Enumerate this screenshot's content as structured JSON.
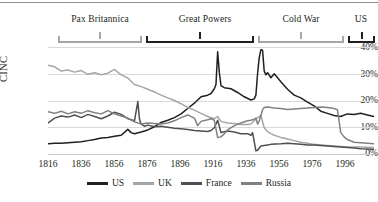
{
  "chart_data": {
    "type": "line",
    "title": "",
    "xlabel": "",
    "ylabel": "CINC",
    "xlim": [
      1816,
      2012
    ],
    "ylim": [
      0,
      0.44
    ],
    "grid": true,
    "legend_position": "bottom",
    "x_ticks": [
      "1816",
      "1836",
      "1856",
      "1876",
      "1896",
      "1916",
      "1936",
      "1956",
      "1976",
      "1996"
    ],
    "x_tick_values": [
      1816,
      1836,
      1856,
      1876,
      1896,
      1916,
      1936,
      1956,
      1976,
      1996
    ],
    "y_ticks": [
      "0%",
      "10%",
      "20%",
      "30%",
      "40%"
    ],
    "y_tick_values": [
      0,
      10,
      20,
      30,
      40
    ],
    "annotations": [
      {
        "label": "Pax Britannica",
        "start": 1816,
        "end": 1866,
        "color": "#a6a6a6"
      },
      {
        "label": "Great Powers",
        "start": 1869,
        "end": 1943,
        "color": "#231f20"
      },
      {
        "label": "Cold War",
        "start": 1945,
        "end": 1989,
        "color": "#a6a6a6"
      },
      {
        "label": "US",
        "start": 1991,
        "end": 2012,
        "color": "#231f20"
      }
    ],
    "series": [
      {
        "name": "US",
        "color": "#231f20",
        "x": [
          1816,
          1820,
          1824,
          1828,
          1832,
          1836,
          1840,
          1844,
          1848,
          1852,
          1856,
          1860,
          1864,
          1866,
          1868,
          1872,
          1876,
          1880,
          1884,
          1888,
          1892,
          1896,
          1900,
          1904,
          1908,
          1912,
          1914,
          1916,
          1917,
          1918,
          1919,
          1920,
          1922,
          1926,
          1930,
          1934,
          1938,
          1940,
          1941,
          1942,
          1943,
          1944,
          1945,
          1946,
          1947,
          1948,
          1950,
          1952,
          1956,
          1960,
          1964,
          1968,
          1972,
          1976,
          1980,
          1984,
          1988,
          1992,
          1996,
          2000,
          2004,
          2008,
          2012
        ],
        "y": [
          3.8,
          4.0,
          4.0,
          4.2,
          4.4,
          4.6,
          5.0,
          5.4,
          6.0,
          6.2,
          6.6,
          7.0,
          9.2,
          8.0,
          7.6,
          8.2,
          9.0,
          10.2,
          11.8,
          12.6,
          13.6,
          15.0,
          17.0,
          19.0,
          21.4,
          22.0,
          22.6,
          24.4,
          26.0,
          38.2,
          30.5,
          25.6,
          24.8,
          24.4,
          23.0,
          21.4,
          20.2,
          20.6,
          22.0,
          30.0,
          36.0,
          39.0,
          38.8,
          31.0,
          29.6,
          30.4,
          28.5,
          30.0,
          27.0,
          24.2,
          22.0,
          21.0,
          19.4,
          18.0,
          16.0,
          15.2,
          14.4,
          14.0,
          15.0,
          14.8,
          15.2,
          14.6,
          14.0
        ]
      },
      {
        "name": "UK",
        "color": "#a6a6a6",
        "x": [
          1816,
          1820,
          1824,
          1828,
          1832,
          1836,
          1840,
          1844,
          1848,
          1852,
          1856,
          1860,
          1864,
          1868,
          1872,
          1876,
          1880,
          1884,
          1888,
          1892,
          1896,
          1900,
          1904,
          1908,
          1912,
          1916,
          1918,
          1920,
          1924,
          1928,
          1932,
          1936,
          1938,
          1940,
          1942,
          1944,
          1946,
          1948,
          1950,
          1952,
          1956,
          1960,
          1964,
          1968,
          1972,
          1976,
          1980,
          1984,
          1988,
          1992,
          1996,
          2000,
          2004,
          2008,
          2012
        ],
        "y": [
          33.2,
          32.6,
          31.0,
          31.4,
          30.6,
          31.2,
          29.8,
          30.4,
          29.6,
          30.2,
          31.6,
          29.6,
          28.4,
          26.0,
          25.2,
          24.2,
          23.2,
          22.0,
          21.0,
          20.0,
          18.8,
          17.4,
          16.4,
          15.2,
          14.0,
          13.2,
          14.0,
          12.2,
          11.6,
          11.4,
          11.0,
          11.0,
          11.2,
          12.4,
          13.6,
          14.4,
          9.8,
          8.4,
          7.6,
          7.0,
          6.2,
          5.6,
          5.0,
          4.4,
          4.0,
          3.6,
          3.4,
          3.2,
          3.0,
          2.8,
          2.6,
          2.6,
          2.6,
          2.5,
          2.4
        ]
      },
      {
        "name": "France",
        "color": "#4f4f4f",
        "x": [
          1816,
          1820,
          1824,
          1828,
          1832,
          1836,
          1840,
          1844,
          1848,
          1852,
          1856,
          1860,
          1864,
          1866,
          1868,
          1870,
          1871,
          1872,
          1874,
          1876,
          1880,
          1884,
          1888,
          1892,
          1896,
          1900,
          1904,
          1908,
          1912,
          1914,
          1916,
          1918,
          1920,
          1924,
          1928,
          1932,
          1936,
          1938,
          1939,
          1940,
          1941,
          1942,
          1944,
          1946,
          1948,
          1950,
          1956,
          1960,
          1964,
          1968,
          1972,
          1976,
          1980,
          1984,
          1988,
          1992,
          1996,
          2000,
          2004,
          2008,
          2012
        ],
        "y": [
          11.6,
          13.4,
          14.2,
          13.8,
          14.6,
          13.6,
          14.8,
          14.0,
          13.2,
          14.2,
          15.6,
          14.8,
          13.2,
          12.8,
          12.4,
          19.6,
          13.0,
          11.2,
          10.4,
          10.8,
          10.2,
          10.4,
          10.0,
          9.6,
          9.4,
          9.2,
          8.8,
          8.6,
          8.4,
          8.8,
          9.8,
          12.6,
          8.0,
          8.6,
          8.2,
          7.6,
          7.6,
          7.0,
          8.0,
          4.6,
          1.2,
          1.4,
          3.0,
          3.2,
          3.4,
          3.6,
          3.8,
          4.0,
          3.8,
          3.6,
          3.4,
          3.4,
          3.2,
          3.0,
          2.8,
          2.6,
          2.4,
          2.2,
          2.0,
          1.9,
          1.8
        ]
      },
      {
        "name": "Russia",
        "color": "#808080",
        "x": [
          1816,
          1820,
          1824,
          1828,
          1832,
          1836,
          1840,
          1844,
          1848,
          1852,
          1856,
          1860,
          1864,
          1868,
          1872,
          1876,
          1880,
          1884,
          1888,
          1892,
          1896,
          1900,
          1904,
          1906,
          1908,
          1912,
          1914,
          1916,
          1917,
          1918,
          1920,
          1922,
          1924,
          1928,
          1932,
          1936,
          1938,
          1940,
          1941,
          1942,
          1943,
          1944,
          1945,
          1946,
          1948,
          1950,
          1952,
          1956,
          1960,
          1964,
          1968,
          1972,
          1976,
          1980,
          1984,
          1988,
          1990,
          1992,
          1994,
          1996,
          2000,
          2004,
          2008,
          2012
        ],
        "y": [
          15.8,
          15.2,
          16.0,
          15.0,
          15.8,
          15.2,
          16.2,
          15.4,
          15.0,
          16.2,
          15.0,
          14.2,
          13.4,
          12.0,
          11.2,
          11.6,
          11.4,
          11.2,
          11.6,
          12.4,
          13.6,
          14.6,
          13.4,
          10.6,
          12.2,
          12.8,
          13.2,
          12.6,
          9.4,
          6.2,
          6.4,
          7.6,
          9.0,
          10.6,
          11.6,
          12.4,
          12.6,
          13.0,
          13.4,
          11.2,
          12.4,
          14.4,
          16.6,
          17.4,
          17.6,
          17.4,
          17.2,
          17.0,
          16.6,
          16.8,
          17.0,
          17.2,
          17.4,
          17.6,
          17.4,
          17.0,
          16.6,
          8.0,
          6.4,
          5.4,
          4.4,
          4.2,
          4.0,
          3.8
        ]
      }
    ]
  },
  "legend": {
    "items": [
      {
        "label": "US",
        "color": "#231f20"
      },
      {
        "label": "UK",
        "color": "#a6a6a6"
      },
      {
        "label": "France",
        "color": "#4f4f4f"
      },
      {
        "label": "Russia",
        "color": "#808080"
      }
    ]
  }
}
